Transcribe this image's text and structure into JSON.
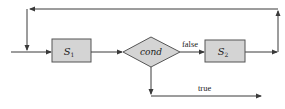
{
  "diagram": {
    "type": "flowchart",
    "colors": {
      "line": "#3a3a3a",
      "box_fill": "#d4d4d4",
      "box_stroke": "#555555",
      "background": "#ffffff"
    },
    "nodes": [
      {
        "id": "s1",
        "shape": "rect",
        "label": "S",
        "subscript": "1"
      },
      {
        "id": "cond",
        "shape": "diamond",
        "label": "cond"
      },
      {
        "id": "s2",
        "shape": "rect",
        "label": "S",
        "subscript": "2"
      }
    ],
    "edges": [
      {
        "from": "entry",
        "to": "s1",
        "label": ""
      },
      {
        "from": "s1",
        "to": "cond",
        "label": ""
      },
      {
        "from": "cond",
        "to": "s2",
        "label": "false"
      },
      {
        "from": "s2",
        "to": "entry",
        "label": "",
        "route": "loop back over top"
      },
      {
        "from": "cond",
        "to": "exit",
        "label": "true"
      }
    ],
    "labels": {
      "s1_main": "S",
      "s1_sub": "1",
      "cond": "cond",
      "s2_main": "S",
      "s2_sub": "2",
      "false_edge": "false",
      "true_edge": "true"
    }
  }
}
